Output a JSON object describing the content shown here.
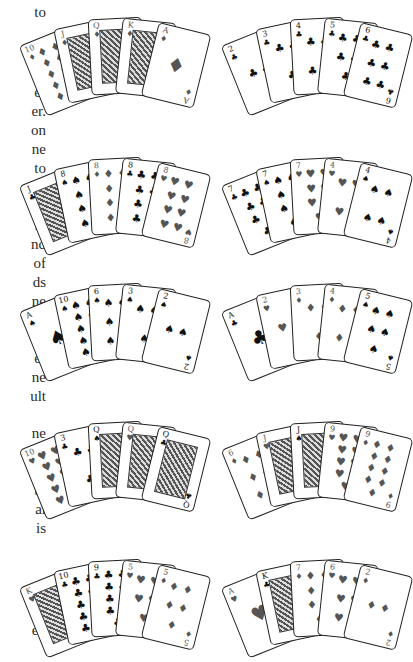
{
  "text_fragments": [
    {
      "text": "to",
      "top": 3
    },
    {
      "text": "ch",
      "top": 64
    },
    {
      "text": "er",
      "top": 83
    },
    {
      "text": "er.",
      "top": 102
    },
    {
      "text": "on",
      "top": 121
    },
    {
      "text": "ne",
      "top": 140
    },
    {
      "text": "to",
      "top": 159
    },
    {
      "text": "ne",
      "top": 178
    },
    {
      "text": "er",
      "top": 197
    },
    {
      "text": "n,",
      "top": 216
    },
    {
      "text": "nd",
      "top": 235
    },
    {
      "text": "of",
      "top": 254
    },
    {
      "text": "ds",
      "top": 273
    },
    {
      "text": "ne",
      "top": 292
    },
    {
      "text": "et-",
      "top": 311
    },
    {
      "text": "ne",
      "top": 330
    },
    {
      "text": "er",
      "top": 349
    },
    {
      "text": "ne",
      "top": 368
    },
    {
      "text": "ult",
      "top": 387
    },
    {
      "text": "ne",
      "top": 424
    },
    {
      "text": "al-",
      "top": 443
    },
    {
      "text": "be",
      "top": 462
    },
    {
      "text": "ty",
      "top": 481
    },
    {
      "text": "al",
      "top": 500
    },
    {
      "text": "is",
      "top": 519
    },
    {
      "text": "ne",
      "top": 583
    },
    {
      "text": "es",
      "top": 602
    },
    {
      "text": "ed",
      "top": 621
    }
  ],
  "hands": [
    {
      "name": "royal-flush",
      "left": 40,
      "top": 6,
      "cards": [
        {
          "rank": "10",
          "suit": "♦",
          "color": "red",
          "type": "pips",
          "n": 10
        },
        {
          "rank": "J",
          "suit": "♦",
          "color": "red",
          "type": "face"
        },
        {
          "rank": "Q",
          "suit": "♦",
          "color": "red",
          "type": "face"
        },
        {
          "rank": "K",
          "suit": "♦",
          "color": "red",
          "type": "face"
        },
        {
          "rank": "A",
          "suit": "♦",
          "color": "red",
          "type": "ace"
        }
      ]
    },
    {
      "name": "straight-flush",
      "left": 242,
      "top": 6,
      "cards": [
        {
          "rank": "2",
          "suit": "♣",
          "color": "blk",
          "type": "pips",
          "n": 2
        },
        {
          "rank": "3",
          "suit": "♣",
          "color": "blk",
          "type": "pips",
          "n": 3
        },
        {
          "rank": "4",
          "suit": "♣",
          "color": "blk",
          "type": "pips",
          "n": 4
        },
        {
          "rank": "5",
          "suit": "♣",
          "color": "blk",
          "type": "pips",
          "n": 5
        },
        {
          "rank": "6",
          "suit": "♣",
          "color": "blk",
          "type": "pips",
          "n": 6
        }
      ]
    },
    {
      "name": "four-of-a-kind",
      "left": 40,
      "top": 146,
      "cards": [
        {
          "rank": "J",
          "suit": "♣",
          "color": "blk",
          "type": "face"
        },
        {
          "rank": "8",
          "suit": "♠",
          "color": "blk",
          "type": "pips",
          "n": 8
        },
        {
          "rank": "8",
          "suit": "♦",
          "color": "red",
          "type": "pips",
          "n": 8
        },
        {
          "rank": "8",
          "suit": "♣",
          "color": "blk",
          "type": "pips",
          "n": 8
        },
        {
          "rank": "8",
          "suit": "♥",
          "color": "red",
          "type": "pips",
          "n": 8
        }
      ]
    },
    {
      "name": "full-house",
      "left": 242,
      "top": 146,
      "cards": [
        {
          "rank": "7",
          "suit": "♣",
          "color": "blk",
          "type": "pips",
          "n": 7
        },
        {
          "rank": "7",
          "suit": "♠",
          "color": "blk",
          "type": "pips",
          "n": 7
        },
        {
          "rank": "7",
          "suit": "♥",
          "color": "red",
          "type": "pips",
          "n": 7
        },
        {
          "rank": "4",
          "suit": "♥",
          "color": "red",
          "type": "pips",
          "n": 4
        },
        {
          "rank": "4",
          "suit": "♠",
          "color": "blk",
          "type": "pips",
          "n": 4
        }
      ]
    },
    {
      "name": "flush",
      "left": 40,
      "top": 272,
      "cards": [
        {
          "rank": "A",
          "suit": "♠",
          "color": "blk",
          "type": "ace"
        },
        {
          "rank": "10",
          "suit": "♠",
          "color": "blk",
          "type": "pips",
          "n": 10
        },
        {
          "rank": "6",
          "suit": "♠",
          "color": "blk",
          "type": "pips",
          "n": 6
        },
        {
          "rank": "3",
          "suit": "♠",
          "color": "blk",
          "type": "pips",
          "n": 3
        },
        {
          "rank": "2",
          "suit": "♠",
          "color": "blk",
          "type": "pips",
          "n": 2
        }
      ]
    },
    {
      "name": "straight",
      "left": 242,
      "top": 272,
      "cards": [
        {
          "rank": "A",
          "suit": "♣",
          "color": "blk",
          "type": "ace"
        },
        {
          "rank": "2",
          "suit": "♥",
          "color": "red",
          "type": "pips",
          "n": 2
        },
        {
          "rank": "3",
          "suit": "♦",
          "color": "red",
          "type": "pips",
          "n": 3
        },
        {
          "rank": "4",
          "suit": "♦",
          "color": "red",
          "type": "pips",
          "n": 4
        },
        {
          "rank": "5",
          "suit": "♠",
          "color": "blk",
          "type": "pips",
          "n": 5
        }
      ]
    },
    {
      "name": "three-of-a-kind",
      "left": 40,
      "top": 410,
      "cards": [
        {
          "rank": "10",
          "suit": "♥",
          "color": "red",
          "type": "pips",
          "n": 10
        },
        {
          "rank": "3",
          "suit": "♣",
          "color": "blk",
          "type": "pips",
          "n": 3
        },
        {
          "rank": "Q",
          "suit": "♠",
          "color": "blk",
          "type": "face"
        },
        {
          "rank": "Q",
          "suit": "♥",
          "color": "red",
          "type": "face"
        },
        {
          "rank": "Q",
          "suit": "♣",
          "color": "blk",
          "type": "face"
        }
      ]
    },
    {
      "name": "two-pair",
      "left": 242,
      "top": 410,
      "cards": [
        {
          "rank": "6",
          "suit": "♦",
          "color": "red",
          "type": "pips",
          "n": 6
        },
        {
          "rank": "J",
          "suit": "♥",
          "color": "red",
          "type": "face"
        },
        {
          "rank": "J",
          "suit": "♠",
          "color": "blk",
          "type": "face"
        },
        {
          "rank": "9",
          "suit": "♥",
          "color": "red",
          "type": "pips",
          "n": 9
        },
        {
          "rank": "9",
          "suit": "♦",
          "color": "red",
          "type": "pips",
          "n": 9
        }
      ]
    },
    {
      "name": "one-pair",
      "left": 40,
      "top": 548,
      "cards": [
        {
          "rank": "K",
          "suit": "♥",
          "color": "red",
          "type": "face"
        },
        {
          "rank": "10",
          "suit": "♣",
          "color": "blk",
          "type": "pips",
          "n": 10
        },
        {
          "rank": "9",
          "suit": "♣",
          "color": "blk",
          "type": "pips",
          "n": 9
        },
        {
          "rank": "5",
          "suit": "♥",
          "color": "red",
          "type": "pips",
          "n": 5
        },
        {
          "rank": "5",
          "suit": "♦",
          "color": "red",
          "type": "pips",
          "n": 5
        }
      ]
    },
    {
      "name": "high-card",
      "left": 242,
      "top": 548,
      "cards": [
        {
          "rank": "A",
          "suit": "♥",
          "color": "red",
          "type": "ace"
        },
        {
          "rank": "K",
          "suit": "♣",
          "color": "blk",
          "type": "face"
        },
        {
          "rank": "7",
          "suit": "♦",
          "color": "red",
          "type": "pips",
          "n": 7
        },
        {
          "rank": "6",
          "suit": "♥",
          "color": "red",
          "type": "pips",
          "n": 6
        },
        {
          "rank": "2",
          "suit": "♦",
          "color": "red",
          "type": "pips",
          "n": 2
        }
      ]
    }
  ]
}
